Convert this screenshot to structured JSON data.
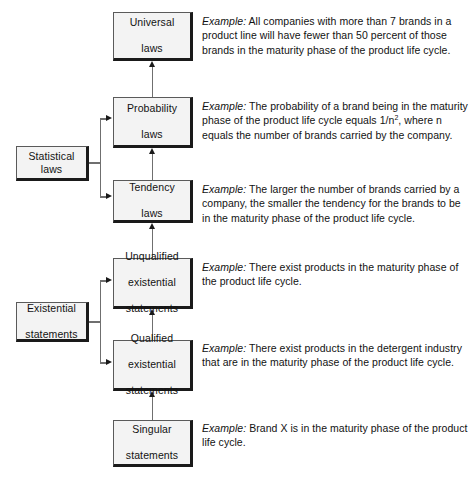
{
  "diagram": {
    "colors": {
      "box_fill": "#f3f3f3",
      "box_border": "#1a1a1a",
      "connector": "#6f6f6f",
      "background": "#ffffff",
      "text": "#121212"
    },
    "nodes": [
      {
        "id": "universal",
        "label": "Universal\nlaws"
      },
      {
        "id": "probability",
        "label": "Probability\nlaws"
      },
      {
        "id": "tendency",
        "label": "Tendency\nlaws"
      },
      {
        "id": "unqualified",
        "label": "Unqualified\nexistential\nstatements"
      },
      {
        "id": "qualified",
        "label": "Qualified\nexistential\nstatements"
      },
      {
        "id": "singular",
        "label": "Singular\nstatements"
      }
    ],
    "groups": [
      {
        "id": "statistical",
        "label": "Statistical laws",
        "members": [
          "probability",
          "tendency"
        ]
      },
      {
        "id": "existential",
        "label": "Existential statements",
        "members": [
          "unqualified",
          "qualified"
        ]
      }
    ],
    "node_labels": {
      "universal_line1": "Universal",
      "universal_line2": "laws",
      "probability_line1": "Probability",
      "probability_line2": "laws",
      "tendency_line1": "Tendency",
      "tendency_line2": "laws",
      "unqualified_line1": "Unqualified",
      "unqualified_line2": "existential",
      "unqualified_line3": "statements",
      "qualified_line1": "Qualified",
      "qualified_line2": "existential",
      "qualified_line3": "statements",
      "singular_line1": "Singular",
      "singular_line2": "statements",
      "statistical_label": "Statistical laws",
      "existential_line1": "Existential",
      "existential_line2": "statements"
    },
    "example_lead": "Example:",
    "examples": {
      "universal": "All companies with more than 7 brands in a product line will have fewer than 50 percent of those brands in the maturity phase of the product life cycle.",
      "probability_part1": "The probability of a brand being in the maturity phase of the product life cycle equals 1/n",
      "probability_superscript": "2",
      "probability_part2": ", where n equals the number of brands carried by the company.",
      "tendency": "The larger the number of brands carried by a company, the smaller the tendency for the brands to be in the maturity phase of the product life cycle.",
      "unqualified": "There exist products in the maturity phase of the product life cycle.",
      "qualified": "There exist products in the detergent industry that are in the maturity phase of the product life cycle.",
      "singular": "Brand X is in the maturity phase of the product life cycle."
    }
  }
}
